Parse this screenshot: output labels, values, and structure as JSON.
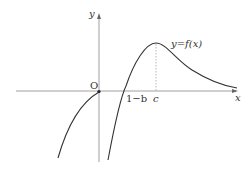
{
  "diagram": {
    "axes": {
      "x_label": "x",
      "y_label": "y",
      "origin_label": "O"
    },
    "curve_label": "y=f(x)",
    "tick_labels": {
      "zero_crossing": "1−b",
      "peak_x": "c"
    },
    "colors": {
      "axis": "#888888",
      "curve": "#333333",
      "dashed": "#999999"
    }
  }
}
